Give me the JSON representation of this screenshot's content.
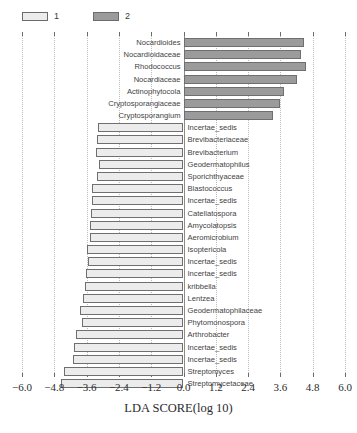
{
  "legend": {
    "entries": [
      {
        "label": "1",
        "group": "group1",
        "color": "#ececec"
      },
      {
        "label": "2",
        "group": "group2",
        "color": "#9b9b9b"
      }
    ]
  },
  "axis": {
    "title": "LDA SCORE(log 10)",
    "ticks": [
      "-6.0",
      "-4.8",
      "-3.6",
      "-2.4",
      "-1.2",
      "0.0",
      "1.2",
      "2.4",
      "3.6",
      "4.8",
      "6.0"
    ],
    "tick_values": [
      -6.0,
      -4.8,
      -3.6,
      -2.4,
      -1.2,
      0.0,
      1.2,
      2.4,
      3.6,
      4.8,
      6.0
    ],
    "min": -6.0,
    "max": 6.0
  },
  "colors": {
    "group1": "#ececec",
    "group2": "#9b9b9b",
    "bar_border": "#6f6f6f",
    "grid": "#bdbdbd",
    "text": "#3f3f3f"
  },
  "chart_data": {
    "type": "bar",
    "orientation": "horizontal-diverging",
    "title": "",
    "xlabel": "LDA SCORE(log 10)",
    "ylabel": "",
    "xlim": [
      -6.0,
      6.0
    ],
    "grid": true,
    "legend_position": "top-left",
    "categories": [
      "Nocardioides",
      "Nocardioidaceae",
      "Rhodococcus",
      "Nocardiaceae",
      "Actinophytocola",
      "Cryptosporangiaceae",
      "Cryptosporangium",
      "Incertae_sedis",
      "Brevibacteriaceae",
      "Brevibacterium",
      "Geodermatophilus",
      "Sporichthyaceae",
      "Blastococcus",
      "Incertae_sedis",
      "Catellatospora",
      "Amycolatopsis",
      "Aeromicrobium",
      "Isoptericola",
      "Incertae_sedis",
      "Incertae_sedis",
      "kribbella",
      "Lentzea",
      "Geodermatophilaceae",
      "Phytomonospora",
      "Arthrobacter",
      "Incertae_sedis",
      "Incertae_sedis",
      "Streptomyces",
      "Streptomycetaceae"
    ],
    "groups": [
      "2",
      "2",
      "2",
      "2",
      "2",
      "2",
      "2",
      "1",
      "1",
      "1",
      "1",
      "1",
      "1",
      "1",
      "1",
      "1",
      "1",
      "1",
      "1",
      "1",
      "1",
      "1",
      "1",
      "1",
      "1",
      "1",
      "1",
      "1",
      "1"
    ],
    "values": [
      4.49,
      4.36,
      4.54,
      4.21,
      3.72,
      3.6,
      3.32,
      -3.18,
      -3.2,
      -3.26,
      -3.14,
      -3.23,
      -3.39,
      -3.41,
      -3.44,
      -3.49,
      -3.46,
      -3.59,
      -3.55,
      -3.61,
      -3.66,
      -3.72,
      -3.84,
      -3.77,
      -4.01,
      -4.06,
      -4.1,
      -4.44,
      -4.56
    ]
  }
}
